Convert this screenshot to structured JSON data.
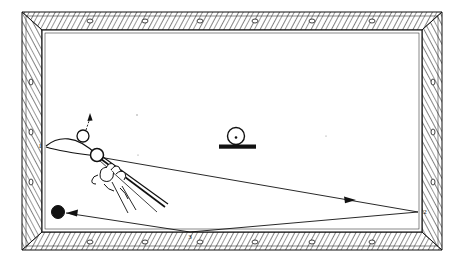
{
  "figure": {
    "kind": "billiards-table-shot-diagram",
    "medium": "black-and-white line drawing",
    "background_color": "#ffffff",
    "ink_color": "#111111",
    "rail_shading": "hatched wood-grain diagonal lines"
  },
  "table": {
    "outer_rail": {
      "x": 22,
      "y": 12,
      "width": 420,
      "height": 238
    },
    "bed": {
      "x": 42,
      "y": 30,
      "width": 380,
      "height": 202
    },
    "rail_width_px": 20,
    "sight_markers_top": 6,
    "sight_markers_bottom": 6,
    "sight_markers_left": 3,
    "sight_markers_right": 3
  },
  "labels": {
    "rail_contact_1": "1",
    "rail_contact_2": "2",
    "rail_contact_3": "3"
  },
  "balls": {
    "cue_ball": {
      "name": "cue-ball",
      "cx": 97,
      "cy": 155,
      "r": 6,
      "fill": "none"
    },
    "object_ball": {
      "name": "object-ball",
      "cx": 83,
      "cy": 136,
      "r": 6,
      "fill": "none"
    },
    "eight_ball": {
      "name": "eight-ball",
      "cx": 58,
      "cy": 212,
      "r": 6,
      "fill": "solid-black"
    },
    "marker_ball": {
      "name": "marker-ball-on-stand",
      "cx": 236,
      "cy": 136,
      "r": 8,
      "fill": "none",
      "has_center_dot": true
    }
  },
  "marker_stand": {
    "x": 219,
    "y": 145,
    "width": 37,
    "height": 4,
    "fill": "solid-black"
  },
  "paths": {
    "curve_arc_label": "curved massé path from left rail to cue ball",
    "long_path_label": "cue ball path to right rail contact 2",
    "return_path_label": "return path from right rail to bottom rail contact 3 and on to the eight ball",
    "object_ball_arrow_label": "object ball departure arrow pointing up-right"
  },
  "cue": {
    "hand_label": "bridge hand gripping cue",
    "stick_label": "cue stick aimed at cue ball"
  },
  "arrowheads": [
    {
      "name": "arrowhead-object-ball-up",
      "x": 89,
      "y": 118
    },
    {
      "name": "arrowhead-right-rail",
      "x": 348,
      "y": 199
    },
    {
      "name": "arrowhead-eight-ball",
      "x": 70,
      "y": 213
    }
  ]
}
